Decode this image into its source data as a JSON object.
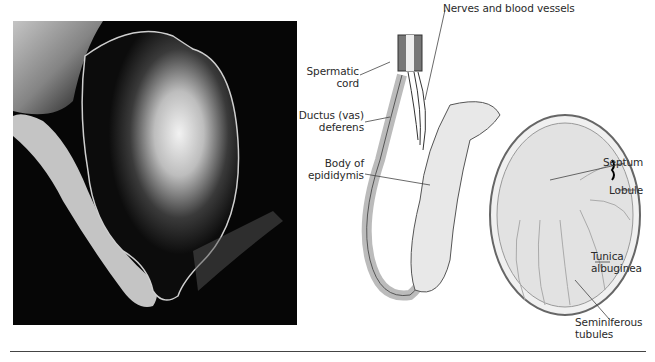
{
  "figure": {
    "photo": {
      "description": "Photograph of a testis and epididymis on dark background"
    },
    "diagram": {
      "labels": {
        "nerves": "Nerves and blood vessels",
        "spermatic_cord_1": "Spermatic",
        "spermatic_cord_2": "cord",
        "ductus_1": "Ductus (vas)",
        "ductus_2": "deferens",
        "body_1": "Body of",
        "body_2": "epididymis",
        "septum": "Septum",
        "lobule": "Lobule",
        "tunica_1": "Tunica",
        "tunica_2": "albuginea",
        "semin_1": "Seminiferous",
        "semin_2": "tubules"
      }
    }
  }
}
